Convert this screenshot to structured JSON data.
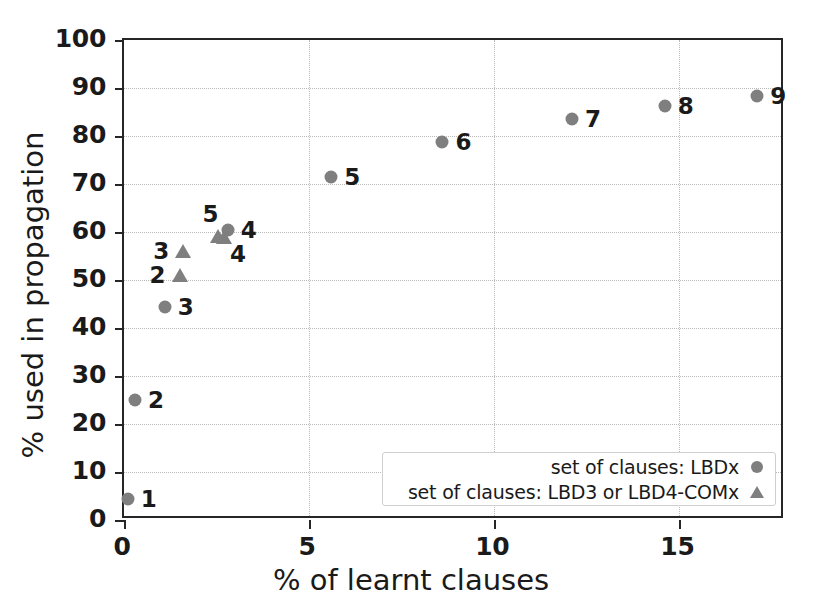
{
  "chart_data": {
    "type": "scatter",
    "title": "",
    "xlabel": "% of learnt clauses",
    "ylabel": "% used in propagation",
    "xlim": [
      0,
      17.85
    ],
    "ylim": [
      0,
      100
    ],
    "xticks": [
      "0",
      "5",
      "10",
      "15"
    ],
    "xtick_values": [
      0,
      5,
      10,
      15
    ],
    "yticks": [
      "0",
      "10",
      "20",
      "30",
      "40",
      "50",
      "60",
      "70",
      "80",
      "90",
      "100"
    ],
    "ytick_values": [
      0,
      10,
      20,
      30,
      40,
      50,
      60,
      70,
      80,
      90,
      100
    ],
    "grid": true,
    "grid_style": "dotted",
    "legend_position": "lower right",
    "marker_color": "#7f7f7f",
    "axis_color": "#262626",
    "series": [
      {
        "name": "set of clauses: LBDx",
        "marker": "circle",
        "color": "#7f7f7f",
        "points": [
          {
            "label": "1",
            "x": 0.1,
            "y": 4.3,
            "label_pos": "right"
          },
          {
            "label": "2",
            "x": 0.3,
            "y": 25.0,
            "label_pos": "right"
          },
          {
            "label": "3",
            "x": 1.1,
            "y": 44.3,
            "label_pos": "right"
          },
          {
            "label": "4",
            "x": 2.8,
            "y": 60.5,
            "label_pos": "right"
          },
          {
            "label": "5",
            "x": 5.6,
            "y": 71.5,
            "label_pos": "right"
          },
          {
            "label": "6",
            "x": 8.6,
            "y": 78.8,
            "label_pos": "right"
          },
          {
            "label": "7",
            "x": 12.1,
            "y": 83.5,
            "label_pos": "right"
          },
          {
            "label": "8",
            "x": 14.6,
            "y": 86.3,
            "label_pos": "right"
          },
          {
            "label": "9",
            "x": 17.1,
            "y": 88.3,
            "label_pos": "right"
          }
        ]
      },
      {
        "name": "set of clauses: LBD3 or LBD4-COMx",
        "marker": "triangle",
        "color": "#7f7f7f",
        "points": [
          {
            "label": "2",
            "x": 1.5,
            "y": 51.0,
            "label_pos": "left"
          },
          {
            "label": "3",
            "x": 1.6,
            "y": 56.0,
            "label_pos": "left"
          },
          {
            "label": "4",
            "x": 2.7,
            "y": 59.0,
            "label_pos": "below"
          },
          {
            "label": "5",
            "x": 2.55,
            "y": 59.2,
            "label_pos": "above"
          }
        ]
      }
    ]
  },
  "legend": {
    "entries": [
      {
        "label": "set of clauses: LBDx",
        "marker": "circle"
      },
      {
        "label": "set of clauses: LBD3 or LBD4-COMx",
        "marker": "triangle"
      }
    ]
  }
}
